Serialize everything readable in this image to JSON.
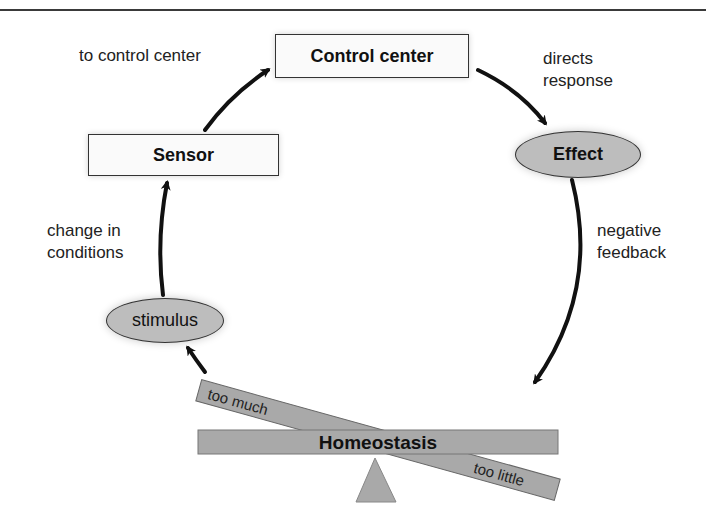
{
  "nodes": {
    "control_center": "Control center",
    "sensor": "Sensor",
    "effect": "Effect",
    "stimulus": "stimulus",
    "homeostasis": "Homeostasis"
  },
  "edge_labels": {
    "to_control_center": "to control center",
    "directs_response_line1": "directs",
    "directs_response_line2": "response",
    "negative_feedback_line1": "negative",
    "negative_feedback_line2": "feedback",
    "change_in_conditions_line1": "change in",
    "change_in_conditions_line2": "conditions"
  },
  "balance": {
    "too_much": "too much",
    "too_little": "too little"
  },
  "colors": {
    "node_fill_gray": "#bdbdbd",
    "bar_fill": "#a9a9a9",
    "stroke": "#333333",
    "arrow": "#111111",
    "box_fill": "#fafafa"
  }
}
